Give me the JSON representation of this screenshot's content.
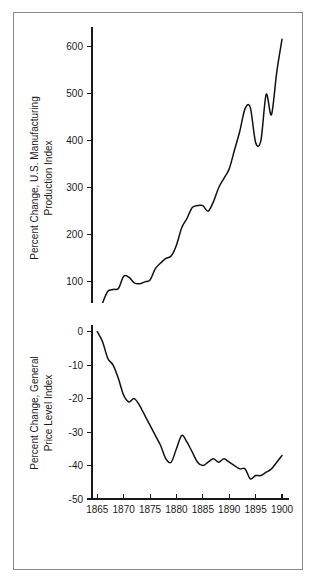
{
  "figure": {
    "background_color": "#ffffff",
    "line_color": "#111111",
    "frame_color": "#8a8a8a",
    "panel_count": 2
  },
  "chart_data": [
    {
      "id": "manufacturing-production",
      "type": "line",
      "title": "",
      "xlabel": "",
      "ylabel": "Percent Change, U.S. Manufacturing Production Index",
      "ylabel_line1": "Percent Change, U.S. Manufacturing",
      "ylabel_line2": "Production Index",
      "xlim": [
        1864,
        1900
      ],
      "ylim": [
        0,
        620
      ],
      "grid": false,
      "legend": "none",
      "xticks": [
        1865,
        1870,
        1875,
        1880,
        1885,
        1890,
        1895,
        1900
      ],
      "xticklabels": [
        "1865",
        "1870",
        "1875",
        "1880",
        "1885",
        "1890",
        "1895",
        "1900"
      ],
      "yticks": [
        0,
        100,
        200,
        300,
        400,
        500,
        600
      ],
      "yticklabels": [
        "0",
        "100",
        "200",
        "300",
        "400",
        "500",
        "600"
      ],
      "series": [
        {
          "name": "U.S. Manufacturing Production Index",
          "x": [
            1864,
            1865,
            1866,
            1867,
            1868,
            1869,
            1870,
            1871,
            1872,
            1873,
            1874,
            1875,
            1876,
            1877,
            1878,
            1879,
            1880,
            1881,
            1882,
            1883,
            1884,
            1885,
            1886,
            1887,
            1888,
            1889,
            1890,
            1891,
            1892,
            1893,
            1894,
            1895,
            1896,
            1897,
            1898,
            1899,
            1900
          ],
          "y": [
            2,
            20,
            55,
            80,
            84,
            86,
            112,
            110,
            98,
            96,
            100,
            104,
            128,
            140,
            150,
            155,
            178,
            215,
            235,
            258,
            262,
            262,
            250,
            270,
            300,
            320,
            340,
            380,
            420,
            468,
            470,
            396,
            400,
            498,
            455,
            545,
            615
          ]
        }
      ]
    },
    {
      "id": "general-price-level",
      "type": "line",
      "title": "",
      "xlabel": "",
      "ylabel": "Percent Change, General Price Level Index",
      "ylabel_line1": "Percent Change, General",
      "ylabel_line2": "Price Level Index",
      "xlim": [
        1864,
        1900
      ],
      "ylim": [
        -50,
        2
      ],
      "grid": false,
      "legend": "none",
      "xticks": [
        1865,
        1870,
        1875,
        1880,
        1885,
        1890,
        1895,
        1900
      ],
      "xticklabels": [
        "1865",
        "1870",
        "1875",
        "1880",
        "1885",
        "1890",
        "1895",
        "1900"
      ],
      "yticks": [
        0,
        -10,
        -20,
        -30,
        -40,
        -50
      ],
      "yticklabels": [
        "0",
        "-10",
        "-20",
        "-30",
        "-40",
        "-50"
      ],
      "series": [
        {
          "name": "General Price Level Index",
          "x": [
            1865,
            1866,
            1867,
            1868,
            1869,
            1870,
            1871,
            1872,
            1873,
            1874,
            1875,
            1876,
            1877,
            1878,
            1879,
            1880,
            1881,
            1882,
            1883,
            1884,
            1885,
            1886,
            1887,
            1888,
            1889,
            1890,
            1891,
            1892,
            1893,
            1894,
            1895,
            1896,
            1897,
            1898,
            1899,
            1900
          ],
          "y": [
            0,
            -3,
            -8,
            -10,
            -14,
            -19,
            -21,
            -20,
            -22,
            -25,
            -28,
            -31,
            -34,
            -38,
            -39,
            -35,
            -31,
            -33,
            -36,
            -39,
            -40,
            -39,
            -38,
            -39,
            -38,
            -39,
            -40,
            -41,
            -41,
            -44,
            -43,
            -43,
            -42,
            -41,
            -39,
            -37
          ]
        }
      ]
    }
  ]
}
